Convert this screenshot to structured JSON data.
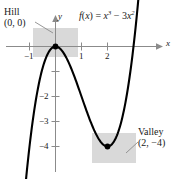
{
  "figure": {
    "formula_plain": "f(x) = x^3 - 3x^2",
    "formula_parts": {
      "fname": "f",
      "arg_open": "(",
      "arg": "x",
      "arg_close": ")",
      "equals": "=",
      "term1_base": "x",
      "term1_exp": "3",
      "minus": "−",
      "term2_coef": "3",
      "term2_base": "x",
      "term2_exp": "2"
    },
    "axis_labels": {
      "x": "x",
      "y": "y"
    },
    "x_ticks": [
      {
        "value": -1,
        "label": "−1"
      },
      {
        "value": 1,
        "label": "1"
      },
      {
        "value": 2,
        "label": "2"
      }
    ],
    "y_ticks": [
      {
        "value": -1,
        "label": ""
      },
      {
        "value": -2,
        "label": "−2"
      },
      {
        "value": -3,
        "label": "−3"
      },
      {
        "value": -4,
        "label": "−4"
      }
    ],
    "annotations": [
      {
        "name": "hill",
        "line1": "Hill",
        "line2": "(0, 0)"
      },
      {
        "name": "valley",
        "line1": "Valley",
        "line2": "(2, −4)"
      }
    ],
    "colors": {
      "curve": "#000000",
      "axis": "#8b8b8b",
      "highlight": "#d9d9d9",
      "text": "#1a1a1a",
      "leader": "#8b8b8b"
    }
  },
  "chart_data": {
    "type": "line",
    "xlabel": "x",
    "ylabel": "y",
    "xlim": [
      -1.45,
      3.3
    ],
    "ylim": [
      -5.2,
      0.85
    ],
    "grid": false,
    "legend": null,
    "xticks": [
      -1,
      1,
      2
    ],
    "xticklabels": [
      "−1",
      "1",
      "2"
    ],
    "yticks": [
      -1,
      -2,
      -3,
      -4
    ],
    "yticklabels": [
      "",
      "−2",
      "−3",
      "−4"
    ],
    "series": [
      {
        "name": "f(x) = x^3 - 3x^2",
        "expression": "x**3 - 3*x**2",
        "x": [
          -1.45,
          -1.3,
          -1.15,
          -1.0,
          -0.85,
          -0.7,
          -0.55,
          -0.4,
          -0.25,
          -0.1,
          0.0,
          0.1,
          0.25,
          0.4,
          0.55,
          0.7,
          0.85,
          1.0,
          1.15,
          1.3,
          1.45,
          1.6,
          1.75,
          1.9,
          2.0,
          2.1,
          2.25,
          2.4,
          2.55,
          2.7,
          2.85,
          3.0,
          3.15,
          3.3
        ],
        "y": [
          -9.35,
          -7.27,
          -5.49,
          -4.0,
          -2.78,
          -1.81,
          -1.07,
          -0.54,
          -0.2,
          -0.03,
          0.0,
          -0.03,
          -0.17,
          -0.42,
          -0.74,
          -1.13,
          -1.55,
          -2.0,
          -2.45,
          -2.87,
          -3.26,
          -3.58,
          -3.83,
          -3.97,
          -4.0,
          -3.97,
          -3.8,
          -3.46,
          -2.93,
          -2.19,
          -1.22,
          0.0,
          1.49,
          3.27
        ]
      }
    ],
    "annotations": [
      {
        "label": "Hill",
        "point": [
          0,
          0
        ],
        "text": "(0, 0)",
        "kind": "local-maximum"
      },
      {
        "label": "Valley",
        "point": [
          2,
          -4
        ],
        "text": "(2, −4)",
        "kind": "local-minimum"
      }
    ],
    "markers": [
      {
        "x": 0,
        "y": 0
      },
      {
        "x": 2,
        "y": -4
      }
    ],
    "highlight_boxes": [
      {
        "name": "hill-box",
        "x_range": [
          -0.85,
          0.9
        ],
        "y_range": [
          -0.45,
          0.72
        ]
      },
      {
        "name": "valley-box",
        "x_range": [
          1.42,
          3.08
        ],
        "y_range": [
          -4.5,
          -3.3
        ]
      }
    ]
  }
}
